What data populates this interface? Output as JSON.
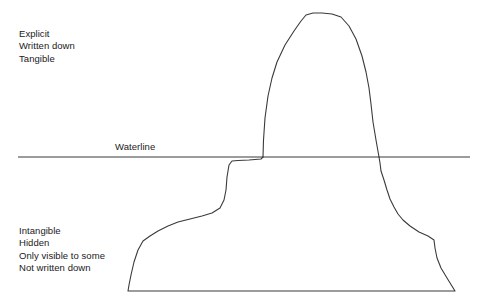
{
  "diagram": {
    "background_color": "#ffffff",
    "stroke_color": "#3a3a3a",
    "stroke_width": 1.1
  },
  "above_water_label": {
    "name": "explicit-label",
    "lines": [
      "Explicit",
      "Written down",
      "Tangible"
    ]
  },
  "waterline": {
    "label": "Waterline",
    "y": 157,
    "x_start": 18,
    "x_end": 470
  },
  "below_water_label": {
    "name": "intangible-label",
    "lines": [
      "Intangible",
      "Hidden",
      "Only visible to some",
      "Not written down"
    ]
  },
  "shapes": {
    "peak_path": "M 263 157 L 263.5 140 L 265 118 L 268 96 L 272 78 L 277 62 L 285 45 L 294 31 L 301 21 L 306 15 L 313 13 L 322 13 L 332 14 L 341 17 L 349 26 L 356 39 L 362 56 L 366 72 L 369 88 L 371 104 L 373 122 L 376 140 L 379 157",
    "keel_path": "M 263 157 L 261 159 L 249 160 L 238 160.5 L 232 161 L 229 165 L 227 177 L 226 190 L 224 200 L 220 208 L 212 213 L 202 216 L 190 219 L 178 222 L 168 226 L 158 231 L 150 236 L 143 241 L 138 250 L 134 262 L 131 275 L 129 285 L 128 291 L 455 291 L 447 278 L 441 268 L 437 258 L 435 248 L 434 240 L 428 236 L 419 232 L 410 226 L 403 220 L 398 214 L 394 207 L 390 199 L 387 190 L 384 180 L 381 171 L 380 163 L 379 157"
  }
}
